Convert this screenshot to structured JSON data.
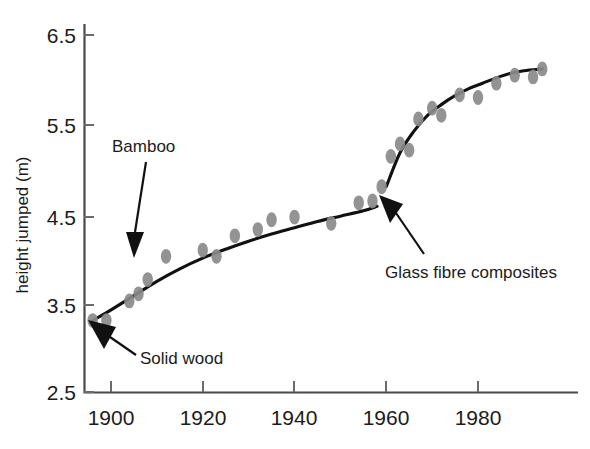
{
  "chart_data": {
    "type": "scatter",
    "title": "",
    "xlabel": "",
    "ylabel": "height jumped (m)",
    "xlim": [
      1894,
      1997
    ],
    "ylim": [
      2.5,
      6.5
    ],
    "xticks": [
      1900,
      1920,
      1940,
      1960,
      1980
    ],
    "xtick_labels": [
      "1900",
      "1920",
      "1940",
      "1960",
      "1980"
    ],
    "yticks": [
      2.5,
      3.5,
      4.5,
      5.5,
      6.5
    ],
    "ytick_labels": [
      "2.5",
      "3.5",
      "4.5",
      "5.5",
      "6.5"
    ],
    "grid": false,
    "legend": "none",
    "point_color": "#8a8a8a",
    "line_color": "#111111",
    "series": [
      {
        "name": "Pole vault world record",
        "x": [
          1896,
          1899,
          1904,
          1906,
          1908,
          1912,
          1920,
          1923,
          1927,
          1932,
          1935,
          1940,
          1948,
          1954,
          1957,
          1959,
          1961,
          1963,
          1965,
          1967,
          1970,
          1972,
          1976,
          1980,
          1984,
          1988,
          1992,
          1994
        ],
        "y": [
          3.3,
          3.3,
          3.52,
          3.6,
          3.76,
          4.02,
          4.09,
          4.02,
          4.25,
          4.32,
          4.43,
          4.46,
          4.39,
          4.62,
          4.64,
          4.8,
          5.14,
          5.28,
          5.21,
          5.56,
          5.68,
          5.6,
          5.83,
          5.8,
          5.96,
          6.05,
          6.03,
          6.12
        ]
      }
    ],
    "fit_segments": [
      {
        "name": "solid-wood-to-bamboo-fit",
        "x": [
          1896,
          1900,
          1905,
          1910,
          1915,
          1920,
          1925,
          1930,
          1935,
          1940,
          1945,
          1950,
          1955,
          1958
        ],
        "y": [
          3.3,
          3.42,
          3.58,
          3.74,
          3.88,
          4.0,
          4.1,
          4.19,
          4.27,
          4.34,
          4.41,
          4.47,
          4.53,
          4.58
        ]
      },
      {
        "name": "glass-fibre-fit",
        "x": [
          1960,
          1963,
          1966,
          1969,
          1972,
          1975,
          1978,
          1981,
          1984,
          1987,
          1990,
          1994
        ],
        "y": [
          4.8,
          5.18,
          5.42,
          5.6,
          5.72,
          5.82,
          5.9,
          5.96,
          6.02,
          6.07,
          6.1,
          6.12
        ]
      }
    ],
    "annotations": [
      {
        "name": "bamboo",
        "label": "Bamboo",
        "label_x": 112,
        "label_y": 152,
        "arrow_from": [
          146,
          162
        ],
        "arrow_to": [
          134,
          250
        ]
      },
      {
        "name": "solid-wood",
        "label": "Solid wood",
        "label_x": 140,
        "label_y": 364,
        "arrow_from": [
          136,
          356
        ],
        "arrow_to": [
          97,
          330
        ]
      },
      {
        "name": "glass-fibre-composites",
        "label": "Glass fibre composites",
        "label_x": 385,
        "label_y": 278,
        "arrow_from": [
          420,
          256
        ],
        "arrow_to": [
          382,
          197
        ]
      }
    ]
  },
  "axis": {
    "y_title": "height jumped (m)",
    "x_tick_1": "1900",
    "x_tick_2": "1920",
    "x_tick_3": "1940",
    "x_tick_4": "1960",
    "x_tick_5": "1980",
    "y_tick_1": "2.5",
    "y_tick_2": "3.5",
    "y_tick_3": "4.5",
    "y_tick_4": "5.5",
    "y_tick_5": "6.5"
  },
  "annotations": {
    "bamboo": "Bamboo",
    "solid_wood": "Solid wood",
    "glass_fibre": "Glass fibre composites"
  }
}
